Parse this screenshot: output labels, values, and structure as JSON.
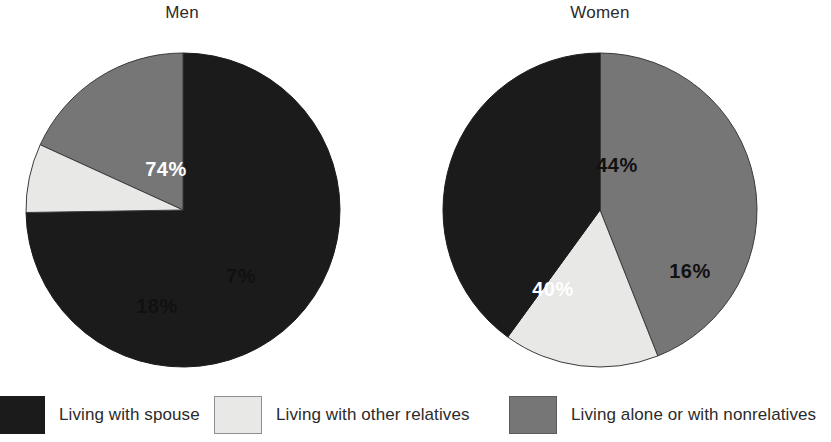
{
  "figure": {
    "panels": [
      {
        "title": "Men"
      },
      {
        "title": "Women"
      }
    ]
  },
  "legend": {
    "items": [
      {
        "label": "Living with spouse",
        "swatch": "legend-swatch-dark",
        "color": "#1b1b1b"
      },
      {
        "label": "Living with other relatives",
        "swatch": "legend-swatch-light",
        "color": "#e8e8e6"
      },
      {
        "label": "Living alone or with nonrelatives",
        "swatch": "legend-swatch-gray",
        "color": "#767676"
      }
    ]
  },
  "labels": {
    "men": {
      "spouse": "74%",
      "other_relatives": "7%",
      "alone": "18%"
    },
    "women": {
      "alone": "44%",
      "other_relatives": "16%",
      "spouse": "40%"
    }
  },
  "chart_data": {
    "type": "pie",
    "title": "",
    "subtitle": "",
    "xlabel": "",
    "ylabel": "",
    "legend_position": "bottom",
    "grid": false,
    "categories": [
      "Living with spouse",
      "Living with other relatives",
      "Living alone or with nonrelatives"
    ],
    "colors": [
      "#1b1b1b",
      "#e8e8e6",
      "#767676"
    ],
    "charts": [
      {
        "title": "Men",
        "slices": [
          {
            "label": "Living with spouse",
            "value": 74,
            "display": "74%",
            "color": "#1b1b1b"
          },
          {
            "label": "Living with other relatives",
            "value": 7,
            "display": "7%",
            "color": "#e8e8e6"
          },
          {
            "label": "Living alone or with nonrelatives",
            "value": 18,
            "display": "18%",
            "color": "#767676"
          }
        ],
        "total": 99
      },
      {
        "title": "Women",
        "slices": [
          {
            "label": "Living alone or with nonrelatives",
            "value": 44,
            "display": "44%",
            "color": "#767676"
          },
          {
            "label": "Living with other relatives",
            "value": 16,
            "display": "16%",
            "color": "#e8e8e6"
          },
          {
            "label": "Living with spouse",
            "value": 40,
            "display": "40%",
            "color": "#1b1b1b"
          }
        ],
        "total": 100
      }
    ]
  }
}
